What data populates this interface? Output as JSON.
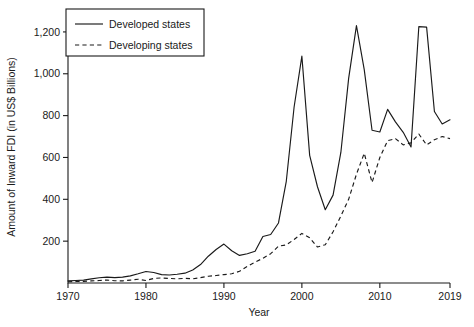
{
  "chart_data": {
    "type": "line",
    "title": "",
    "xlabel": "Year",
    "ylabel": "Amount of Inward FDI (in US$ Billions)",
    "xlim": [
      1970,
      2019
    ],
    "ylim": [
      0,
      1300
    ],
    "grid": false,
    "legend_position": "top-left",
    "xticks": [
      1970,
      1980,
      1990,
      2000,
      2010,
      2019
    ],
    "xticklabels": [
      "1970",
      "1980",
      "1990",
      "2000",
      "2010",
      "2019"
    ],
    "yticks": [
      200,
      400,
      600,
      800,
      1000,
      1200
    ],
    "yticklabels": [
      "200",
      "400",
      "600",
      "800",
      "1,000",
      "1,200"
    ],
    "x": [
      1970,
      1971,
      1972,
      1973,
      1974,
      1975,
      1976,
      1977,
      1978,
      1979,
      1980,
      1981,
      1982,
      1983,
      1984,
      1985,
      1986,
      1987,
      1988,
      1989,
      1990,
      1991,
      1992,
      1993,
      1994,
      1995,
      1996,
      1997,
      1998,
      1999,
      2000,
      2001,
      2002,
      2003,
      2004,
      2005,
      2006,
      2007,
      2008,
      2009,
      2010,
      2011,
      2012,
      2013,
      2014,
      2015,
      2016,
      2017,
      2018,
      2019
    ],
    "series": [
      {
        "name": "Developed states",
        "linestyle": "solid",
        "color": "#1a1a1a",
        "values": [
          10,
          12,
          14,
          20,
          25,
          28,
          26,
          28,
          34,
          44,
          55,
          50,
          40,
          38,
          42,
          47,
          62,
          88,
          128,
          160,
          186,
          154,
          132,
          140,
          152,
          222,
          232,
          287,
          486,
          840,
          1084,
          610,
          460,
          350,
          420,
          624,
          978,
          1230,
          1020,
          730,
          722,
          830,
          770,
          720,
          650,
          1225,
          1223,
          820,
          760,
          780
        ]
      },
      {
        "name": "Developing states",
        "linestyle": "dashed",
        "color": "#1a1a1a",
        "values": [
          6,
          7,
          8,
          10,
          12,
          14,
          11,
          10,
          14,
          18,
          12,
          22,
          24,
          22,
          20,
          22,
          20,
          26,
          32,
          36,
          40,
          44,
          56,
          80,
          100,
          118,
          140,
          176,
          182,
          208,
          237,
          216,
          172,
          183,
          245,
          320,
          400,
          520,
          620,
          480,
          600,
          680,
          690,
          660,
          670,
          712,
          660,
          685,
          700,
          690
        ]
      }
    ]
  }
}
